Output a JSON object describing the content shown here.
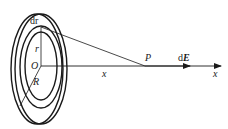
{
  "diagram": {
    "labels": {
      "ring_width": "dr",
      "ring_radius": "r",
      "center": "O",
      "disc_radius": "R",
      "axis_distance": "x",
      "point": "P",
      "field_d": "d",
      "field_E": "E",
      "axis_name": "x"
    },
    "geometry": {
      "center": [
        41,
        66
      ],
      "point_P": [
        145,
        66
      ],
      "axis_end": [
        220,
        66
      ]
    },
    "colors": {
      "stroke": "#1a1a1a",
      "background": "#ffffff"
    }
  }
}
